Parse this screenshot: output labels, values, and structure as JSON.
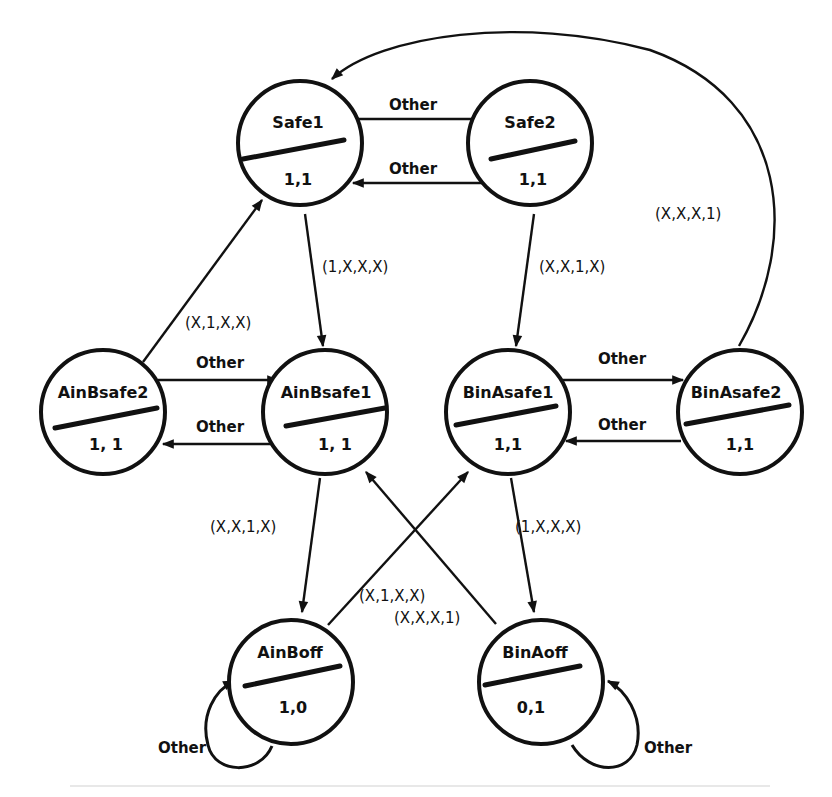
{
  "diagram": {
    "type": "state-transition-diagram",
    "states": [
      {
        "id": "safe1",
        "name": "Safe1",
        "output": "1,1",
        "cx": 300,
        "cy": 143
      },
      {
        "id": "safe2",
        "name": "Safe2",
        "output": "1,1",
        "cx": 530,
        "cy": 143
      },
      {
        "id": "ainbsafe2",
        "name": "AinBsafe2",
        "output": "1, 1",
        "cx": 103,
        "cy": 412
      },
      {
        "id": "ainbsafe1",
        "name": "AinBsafe1",
        "output": "1, 1",
        "cx": 325,
        "cy": 412
      },
      {
        "id": "binasafe1",
        "name": "BinAsafe1",
        "output": "1,1",
        "cx": 508,
        "cy": 412
      },
      {
        "id": "binasafe2",
        "name": "BinAsafe2",
        "output": "1,1",
        "cx": 740,
        "cy": 412
      },
      {
        "id": "ainboff",
        "name": "AinBoff",
        "output": "1,0",
        "cx": 291,
        "cy": 682
      },
      {
        "id": "binaoff",
        "name": "BinAoff",
        "output": "0,1",
        "cx": 541,
        "cy": 682
      }
    ],
    "transitions": [
      {
        "from": "safe1",
        "to": "safe2",
        "label": "Other"
      },
      {
        "from": "safe2",
        "to": "safe1",
        "label": "Other"
      },
      {
        "from": "safe1",
        "to": "ainbsafe1",
        "label": "(1,X,X,X)"
      },
      {
        "from": "safe2",
        "to": "binasafe1",
        "label": "(X,X,1,X)"
      },
      {
        "from": "ainbsafe2",
        "to": "safe1",
        "label": "(X,1,X,X)"
      },
      {
        "from": "binasafe2",
        "to": "safe1",
        "label": "(X,X,X,1)"
      },
      {
        "from": "ainbsafe2",
        "to": "ainbsafe1",
        "label": "Other"
      },
      {
        "from": "ainbsafe1",
        "to": "ainbsafe2",
        "label": "Other"
      },
      {
        "from": "binasafe1",
        "to": "binasafe2",
        "label": "Other"
      },
      {
        "from": "binasafe2",
        "to": "binasafe1",
        "label": "Other"
      },
      {
        "from": "ainbsafe1",
        "to": "ainboff",
        "label": "(X,X,1,X)"
      },
      {
        "from": "binasafe1",
        "to": "binaoff",
        "label": "(1,X,X,X)"
      },
      {
        "from": "ainboff",
        "to": "binasafe1",
        "label": "(X,1,X,X)"
      },
      {
        "from": "binaoff",
        "to": "ainbsafe1",
        "label": "(X,X,X,1)"
      },
      {
        "from": "ainboff",
        "to": "ainboff",
        "label": "Other"
      },
      {
        "from": "binaoff",
        "to": "binaoff",
        "label": "Other"
      }
    ]
  },
  "labels": {
    "safe1_name": "Safe1",
    "safe1_out": "1,1",
    "safe2_name": "Safe2",
    "safe2_out": "1,1",
    "ainbsafe2_name": "AinBsafe2",
    "ainbsafe2_out": "1, 1",
    "ainbsafe1_name": "AinBsafe1",
    "ainbsafe1_out": "1, 1",
    "binasafe1_name": "BinAsafe1",
    "binasafe1_out": "1,1",
    "binasafe2_name": "BinAsafe2",
    "binasafe2_out": "1,1",
    "ainboff_name": "AinBoff",
    "ainboff_out": "1,0",
    "binaoff_name": "BinAoff",
    "binaoff_out": "0,1",
    "e_safe1_safe2": "Other",
    "e_safe2_safe1": "Other",
    "e_safe1_ainbsafe1": "(1,X,X,X)",
    "e_safe2_binasafe1": "(X,X,1,X)",
    "e_ainbsafe2_safe1": "(X,1,X,X)",
    "e_binasafe2_safe1": "(X,X,X,1)",
    "e_ainbsafe2_ainbsafe1": "Other",
    "e_ainbsafe1_ainbsafe2": "Other",
    "e_binasafe1_binasafe2": "Other",
    "e_binasafe2_binasafe1": "Other",
    "e_ainbsafe1_ainboff": "(X,X,1,X)",
    "e_binasafe1_binaoff": "(1,X,X,X)",
    "e_ainboff_binasafe1": "(X,1,X,X)",
    "e_binaoff_ainbsafe1": "(X,X,X,1)",
    "e_ainboff_self": "Other",
    "e_binaoff_self": "Other"
  }
}
